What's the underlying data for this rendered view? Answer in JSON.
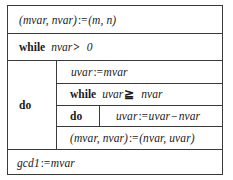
{
  "diagram": {
    "kind": "structured-box-diagram",
    "frame_color": "#3a3a3a",
    "background_color": "#ffffff"
  },
  "keywords": {
    "while": "while",
    "do": "do"
  },
  "symbols": {
    "assign": ":=",
    "greater_than": ">",
    "greater_or_equal": "≧",
    "minus": "−"
  },
  "rows": {
    "init": {
      "name": "initial-assignment",
      "lhs": "(mvar, nvar)",
      "assign": ":=",
      "rhs": "(m, n)",
      "full": "(mvar, nvar) := (m, n)"
    },
    "while_outer": {
      "name": "outer-while",
      "keyword": "while",
      "left": "nvar",
      "op": ">",
      "right": "0",
      "full": "while nvar > 0"
    },
    "do_outer": {
      "name": "outer-do",
      "keyword": "do"
    },
    "uvar_assign": {
      "name": "uvar-assignment",
      "lhs": "uvar",
      "assign": ":=",
      "rhs": "mvar",
      "full": "uvar := mvar"
    },
    "while_inner": {
      "name": "inner-while",
      "keyword": "while",
      "left": "uvar",
      "op": "≧",
      "right": "nvar",
      "full": "uvar ≧ nvar"
    },
    "do_inner": {
      "name": "inner-do",
      "keyword": "do"
    },
    "sub_assign": {
      "name": "subtraction-assignment",
      "lhs": "uvar",
      "assign": ":=",
      "rhs_left": "uvar",
      "rhs_op": "−",
      "rhs_right": "nvar",
      "full": "uvar := uvar − nvar"
    },
    "swap": {
      "name": "swap-assignment",
      "lhs": "(mvar, nvar)",
      "assign": ":=",
      "rhs": "(nvar, uvar)",
      "full": "(mvar, nvar) := (nvar, uvar)"
    },
    "result": {
      "name": "result-assignment",
      "lhs": "gcd1",
      "assign": ":=",
      "rhs": "mvar",
      "full": "gcd1 := mvar"
    }
  }
}
